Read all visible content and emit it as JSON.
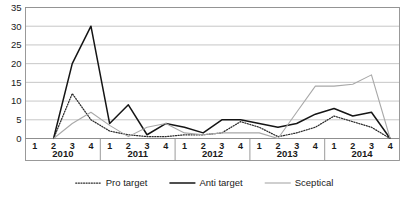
{
  "chart_data": {
    "type": "line",
    "title": "",
    "xlabel": "",
    "ylabel": "",
    "ylim": [
      0,
      35
    ],
    "yticks": [
      0,
      5,
      10,
      15,
      20,
      25,
      30,
      35
    ],
    "grid": true,
    "legend_position": "bottom",
    "x": [
      "2010 1",
      "2010 2",
      "2010 3",
      "2010 4",
      "2011 1",
      "2011 2",
      "2011 3",
      "2011 4",
      "2012 1",
      "2012 2",
      "2012 3",
      "2012 4",
      "2013 1",
      "2013 2",
      "2013 3",
      "2013 4",
      "2014 1",
      "2014 2",
      "2014 3",
      "2014 4"
    ],
    "years": [
      {
        "label": "2010",
        "quarters": [
          "1",
          "2",
          "3",
          "4"
        ]
      },
      {
        "label": "2011",
        "quarters": [
          "1",
          "2",
          "3",
          "4"
        ]
      },
      {
        "label": "2012",
        "quarters": [
          "1",
          "2",
          "3",
          "4"
        ]
      },
      {
        "label": "2013",
        "quarters": [
          "1",
          "2",
          "3",
          "4"
        ]
      },
      {
        "label": "2014",
        "quarters": [
          "1",
          "2",
          "3",
          "4"
        ]
      }
    ],
    "series": [
      {
        "name": "Pro target",
        "style": "dotted",
        "color": "#2b2b2b",
        "values": [
          null,
          0,
          12,
          5,
          2,
          1,
          0.5,
          0.5,
          1,
          1,
          1.5,
          4.5,
          3,
          0.5,
          1.5,
          3,
          6,
          4.5,
          3,
          0
        ]
      },
      {
        "name": "Anti target",
        "style": "solid",
        "color": "#151515",
        "values": [
          null,
          0,
          20,
          30,
          4,
          9,
          1,
          4,
          3,
          1.5,
          5,
          5,
          4,
          3,
          4,
          6.5,
          8,
          6,
          7,
          0
        ]
      },
      {
        "name": "Sceptical",
        "style": "thin",
        "color": "#a8a8a8",
        "values": [
          null,
          0,
          4,
          7,
          3.5,
          0.5,
          3,
          4,
          1.5,
          1,
          1.5,
          1.5,
          1.5,
          0,
          7,
          14,
          14,
          14.5,
          17,
          0
        ]
      }
    ]
  },
  "legend": {
    "items": [
      {
        "label": "Pro target",
        "style": "dotted"
      },
      {
        "label": "Anti target",
        "style": "solid"
      },
      {
        "label": "Sceptical",
        "style": "thin"
      }
    ]
  }
}
